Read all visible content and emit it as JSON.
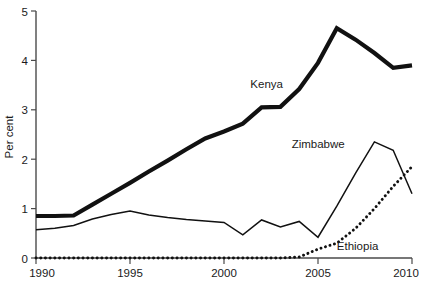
{
  "chart_data": {
    "type": "line",
    "title": "",
    "subtitle": "",
    "xlabel": "",
    "ylabel": "Per cent",
    "xlim": [
      1990,
      2010
    ],
    "ylim": [
      0,
      5
    ],
    "grid": false,
    "legend_position": "inline-annotations",
    "x": [
      1990,
      1991,
      1992,
      1993,
      1994,
      1995,
      1996,
      1997,
      1998,
      1999,
      2000,
      2001,
      2002,
      2003,
      2004,
      2005,
      2006,
      2007,
      2008,
      2009,
      2010
    ],
    "x_ticks": [
      1990,
      1995,
      2000,
      2005,
      2010
    ],
    "x_tick_labels": [
      "1990",
      "1995",
      "2000",
      "2005",
      "2010"
    ],
    "y_ticks": [
      0,
      1,
      2,
      3,
      4,
      5
    ],
    "y_tick_labels": [
      "0",
      "1",
      "2",
      "3",
      "4",
      "5"
    ],
    "series": [
      {
        "name": "Kenya",
        "style": "thick-solid",
        "color": "#111111",
        "label_x": 2001.4,
        "label_y": 3.45,
        "values": [
          0.85,
          0.85,
          0.86,
          1.08,
          1.3,
          1.52,
          1.75,
          1.97,
          2.2,
          2.42,
          2.56,
          2.72,
          3.05,
          3.06,
          3.42,
          3.95,
          4.65,
          4.42,
          4.15,
          3.85,
          3.9
        ]
      },
      {
        "name": "Zimbabwe",
        "style": "thin-solid",
        "color": "#111111",
        "label_x": 2003.6,
        "label_y": 2.22,
        "values": [
          0.57,
          0.6,
          0.66,
          0.79,
          0.88,
          0.95,
          0.87,
          0.82,
          0.78,
          0.75,
          0.72,
          0.47,
          0.77,
          0.63,
          0.74,
          0.42,
          1.05,
          1.72,
          2.35,
          2.18,
          1.3
        ]
      },
      {
        "name": "Ethiopia",
        "style": "dotted",
        "color": "#111111",
        "label_x": 2006.0,
        "label_y": 0.17,
        "values": [
          0.0,
          0.0,
          0.0,
          0.0,
          0.0,
          0.0,
          0.0,
          0.0,
          0.0,
          0.0,
          0.0,
          0.0,
          0.0,
          0.0,
          0.02,
          0.18,
          0.3,
          0.6,
          1.0,
          1.45,
          1.85
        ]
      }
    ]
  }
}
